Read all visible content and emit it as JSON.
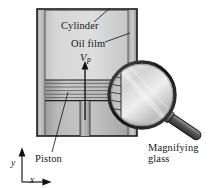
{
  "figure": {
    "background_color": "#ffffff",
    "labels": {
      "cylinder": "Cylinder",
      "oil_film": "Oil film",
      "piston_velocity_symbol": "V",
      "piston_velocity_subscript": "P",
      "piston": "Piston",
      "magnifying_glass_line1": "Magnifying",
      "magnifying_glass_line2": "glass",
      "axis_y": "y",
      "axis_x": "x"
    },
    "colors": {
      "outline": "#1a1b1d",
      "cylinder_wall_light": "#d9d9d9",
      "cylinder_wall_dark": "#8d8d8d",
      "cylinder_interior": "#cfcfcf",
      "piston_face": "#bdbdbd",
      "piston_ring_line": "#4a4a4a",
      "lens_glass": "#e2e2e2",
      "lens_rim": "#2a2a2a",
      "handle_grip": "#575757",
      "label_text": "#17181a",
      "leader_line": "#1a1b1d"
    },
    "parts": [
      "cylinder-body",
      "cylinder-left-wall",
      "cylinder-right-wall",
      "oil-film-gap",
      "piston-head",
      "piston-rings",
      "piston-rod",
      "velocity-arrow",
      "magnifier-lens",
      "magnifier-handle",
      "coordinate-axes"
    ]
  }
}
